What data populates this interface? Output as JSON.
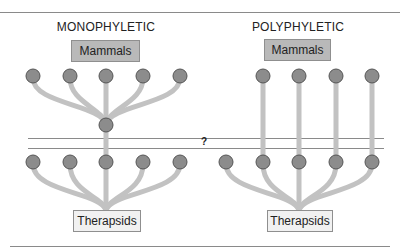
{
  "panels": {
    "left": {
      "title": "MONOPHYLETIC",
      "top_label": "Mammals",
      "bottom_label": "Therapsids"
    },
    "right": {
      "title": "POLYPHYLETIC",
      "top_label": "Mammals",
      "bottom_label": "Therapsids"
    }
  },
  "band": {
    "label": "?"
  },
  "colors": {
    "node_fill": "#8c8c8c",
    "node_stroke": "#555555",
    "branch": "#c2c2c2",
    "mammals_box": "#b9b9b9",
    "therapsids_box": "#f1f1f1",
    "rule": "#8a8a8a"
  }
}
